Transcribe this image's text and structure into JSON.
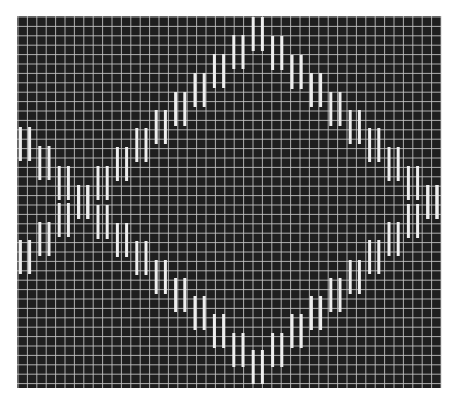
{
  "figure": {
    "description": "Dark grid with pairs of white vertical bars forming two crossing triangle waves (diamond pattern)"
  },
  "colors": {
    "page_background": "#ffffff",
    "plot_background": "#1f1f1f",
    "grid_line": "#c8c8c8",
    "bar": "#eeeeee"
  },
  "plot_area": {
    "x": 17,
    "y": 16,
    "width": 424,
    "height": 372,
    "grid_spacing": 9.4
  },
  "bars": {
    "first_column_center": 25,
    "column_step": 19.4,
    "pair_offset": 4.6,
    "bar_width": 3,
    "bar_height": 34
  },
  "chart_data": {
    "type": "scatter",
    "title": "",
    "xlabel": "",
    "ylabel": "",
    "grid": true,
    "legend": "none",
    "x": [
      0,
      1,
      2,
      3,
      4,
      5,
      6,
      7,
      8,
      9,
      10,
      11,
      12,
      13,
      14,
      15,
      16,
      17,
      18,
      19,
      20,
      21
    ],
    "series": [
      {
        "name": "wave-rising-to-top",
        "marker": "vertical-bar-pair",
        "values_px_top": [
          240,
          222,
          203,
          185,
          166,
          147,
          128,
          110,
          92,
          73,
          54,
          35,
          17,
          36,
          55,
          73,
          92,
          110,
          128,
          147,
          166,
          185
        ]
      },
      {
        "name": "wave-falling-to-bottom",
        "marker": "vertical-bar-pair",
        "values_px_top": [
          127,
          146,
          166,
          185,
          205,
          223,
          241,
          260,
          278,
          296,
          314,
          333,
          350,
          333,
          314,
          296,
          278,
          260,
          240,
          222,
          204,
          185
        ]
      }
    ]
  }
}
